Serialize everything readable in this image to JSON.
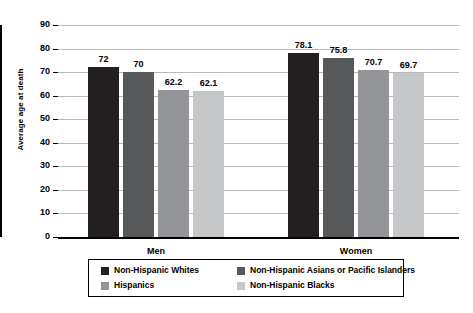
{
  "chart_data": {
    "type": "bar",
    "title": "",
    "xlabel": "",
    "ylabel": "Average age at death",
    "ylim": [
      0,
      90
    ],
    "ytick_step": 10,
    "yticks": [
      "90",
      "80",
      "70",
      "60",
      "50",
      "40",
      "30",
      "20",
      "10",
      "0"
    ],
    "grid": true,
    "legend_position": "bottom",
    "categories": [
      "Men",
      "Women"
    ],
    "series": [
      {
        "name": "Non-Hispanic Whites",
        "color": "#231f20",
        "values": [
          72,
          78.1
        ],
        "labels": [
          "72",
          "78.1"
        ]
      },
      {
        "name": "Non-Hispanic Asians or Pacific Islanders",
        "color": "#58595b",
        "values": [
          70,
          75.8
        ],
        "labels": [
          "70",
          "75.8"
        ]
      },
      {
        "name": "Hispanics",
        "color": "#939598",
        "values": [
          62.2,
          70.7
        ],
        "labels": [
          "62.2",
          "70.7"
        ]
      },
      {
        "name": "Non-Hispanic Blacks",
        "color": "#c6c7c9",
        "values": [
          62.1,
          69.7
        ],
        "labels": [
          "62.1",
          "69.7"
        ]
      }
    ]
  },
  "axis": {
    "y_title": "Average age at death"
  },
  "groups": [
    {
      "label": "Men"
    },
    {
      "label": "Women"
    }
  ],
  "legend": {
    "items": [
      {
        "label": "Non-Hispanic Whites",
        "color": "#231f20"
      },
      {
        "label": "Non-Hispanic Asians or Pacific Islanders",
        "color": "#58595b"
      },
      {
        "label": "Hispanics",
        "color": "#939598"
      },
      {
        "label": "Non-Hispanic Blacks",
        "color": "#c6c7c9"
      }
    ]
  }
}
